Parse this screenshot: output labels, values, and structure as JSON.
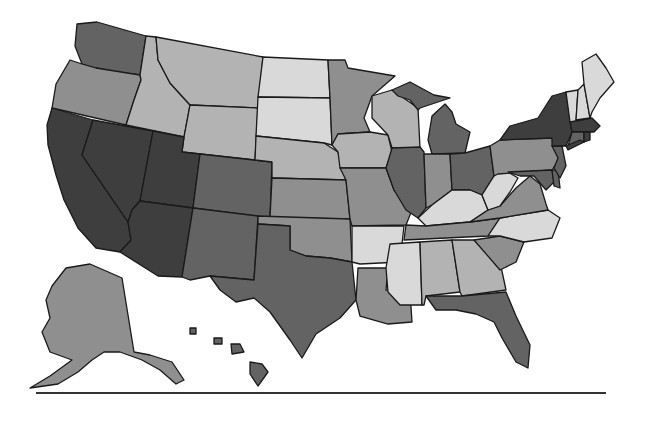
{
  "map": {
    "type": "choropleth",
    "region": "United States",
    "legend_visible": false,
    "shade_levels": [
      {
        "level": 1,
        "color": "#d9d9d9"
      },
      {
        "level": 2,
        "color": "#b3b3b3"
      },
      {
        "level": 3,
        "color": "#8f8f8f"
      },
      {
        "level": 4,
        "color": "#636363"
      },
      {
        "level": 5,
        "color": "#3e3e3e"
      }
    ],
    "states": {
      "WA": 4,
      "OR": 3,
      "CA": 5,
      "NV": 5,
      "ID": 2,
      "MT": 2,
      "WY": 2,
      "UT": 5,
      "AZ": 5,
      "CO": 4,
      "NM": 4,
      "ND": 1,
      "SD": 1,
      "NE": 2,
      "KS": 3,
      "OK": 3,
      "TX": 4,
      "MN": 3,
      "IA": 2,
      "MO": 3,
      "AR": 1,
      "LA": 3,
      "WI": 2,
      "IL": 4,
      "MI": 4,
      "IN": 3,
      "OH": 4,
      "KY": 1,
      "TN": 3,
      "MS": 1,
      "AL": 2,
      "GA": 2,
      "FL": 4,
      "SC": 3,
      "NC": 1,
      "VA": 3,
      "WV": 1,
      "PA": 3,
      "NY": 5,
      "VT": 1,
      "NH": 1,
      "ME": 1,
      "MA": 5,
      "RI": 5,
      "CT": 4,
      "NJ": 4,
      "DE": 4,
      "MD": 4,
      "AK": 3,
      "HI": 4
    }
  },
  "footer": {
    "rule": true
  }
}
